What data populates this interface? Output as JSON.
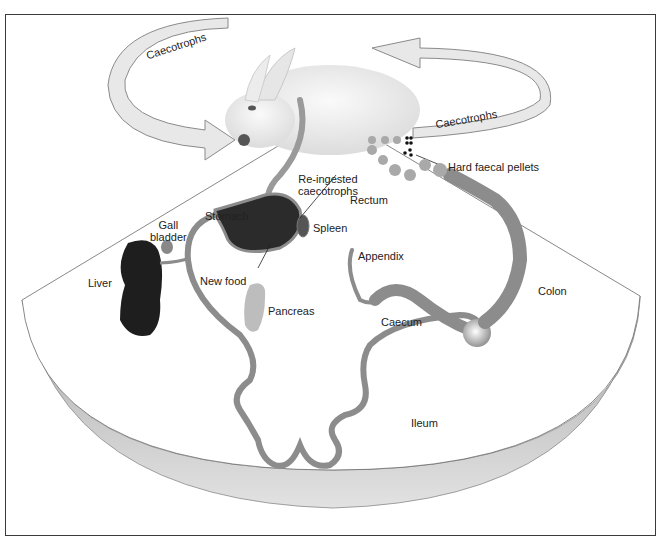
{
  "diagram": {
    "colors": {
      "frame": "#3a3a3a",
      "arrow_fill": "#e8e8e8",
      "arrow_stroke": "#8a8a8a",
      "gut": "#8c8c8c",
      "liver": "#1e1e1e",
      "pancreas": "#bdbdbd",
      "fan_rim": "#b5b5b5"
    },
    "arrows": [
      {
        "label": "Caecotrophs",
        "direction": "to-mouth"
      },
      {
        "label": "Caecotrophs",
        "direction": "from-anus"
      }
    ],
    "labels": {
      "caecotrophs_left": "Caecotrophs",
      "caecotrophs_right": "Caecotrophs",
      "hard_faecal_pellets": "Hard faecal pellets",
      "re_ingested_line1": "Re-ingested",
      "re_ingested_line2": "caecotrophs",
      "rectum": "Rectum",
      "stomach": "Stomach",
      "gall_line1": "Gall",
      "gall_line2": "bladder",
      "spleen": "Spleen",
      "liver": "Liver",
      "new_food": "New food",
      "pancreas": "Pancreas",
      "appendix": "Appendix",
      "colon": "Colon",
      "caecum": "Caecum",
      "ileum": "Ileum"
    }
  }
}
